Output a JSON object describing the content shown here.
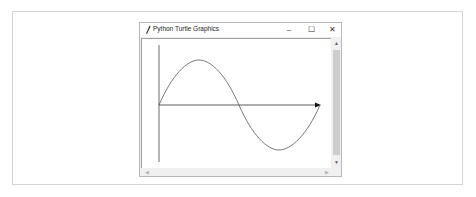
{
  "window": {
    "title": "Python Turtle Graphics",
    "controls": {
      "minimize": "–",
      "maximize": "☐",
      "close": "✕"
    }
  },
  "scrollbars": {
    "vertical": {
      "up": "▲",
      "down": "▼"
    },
    "horizontal": {
      "left": "◀",
      "right": "▶"
    }
  },
  "drawing": {
    "description": "Sine wave with x-axis arrow and y-axis line",
    "colors": {
      "curve": "#555555",
      "axis": "#333333",
      "background": "#ffffff"
    }
  }
}
